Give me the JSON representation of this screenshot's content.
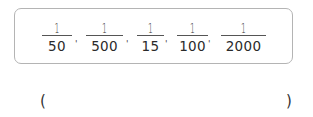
{
  "question": {
    "fractions": [
      {
        "numerator": "1",
        "denominator": "50"
      },
      {
        "numerator": "1",
        "denominator": "500"
      },
      {
        "numerator": "1",
        "denominator": "15"
      },
      {
        "numerator": "1",
        "denominator": "100"
      },
      {
        "numerator": "1",
        "denominator": "2000"
      }
    ],
    "separator": "'"
  },
  "answer": {
    "open_paren": "(",
    "value": "",
    "close_paren": ")"
  },
  "colors": {
    "box_border": "#b4b4b4",
    "text": "#2a2a2a"
  }
}
